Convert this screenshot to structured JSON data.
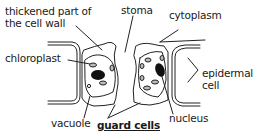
{
  "diagram": {
    "title": "guard cells",
    "labels": {
      "thickened_wall_line1": "thickened part of",
      "thickened_wall_line2": "the cell wall",
      "stoma": "stoma",
      "cytoplasm": "cytoplasm",
      "chloroplast": "chloroplast",
      "epidermal_line1": "epidermal",
      "epidermal_line2": "cell",
      "vacuole": "vacuole",
      "guard_cells": "guard cells",
      "nucleus": "nucleus"
    },
    "colors": {
      "line": "#222222",
      "text": "#1a1a1a",
      "background": "#ffffff"
    }
  }
}
